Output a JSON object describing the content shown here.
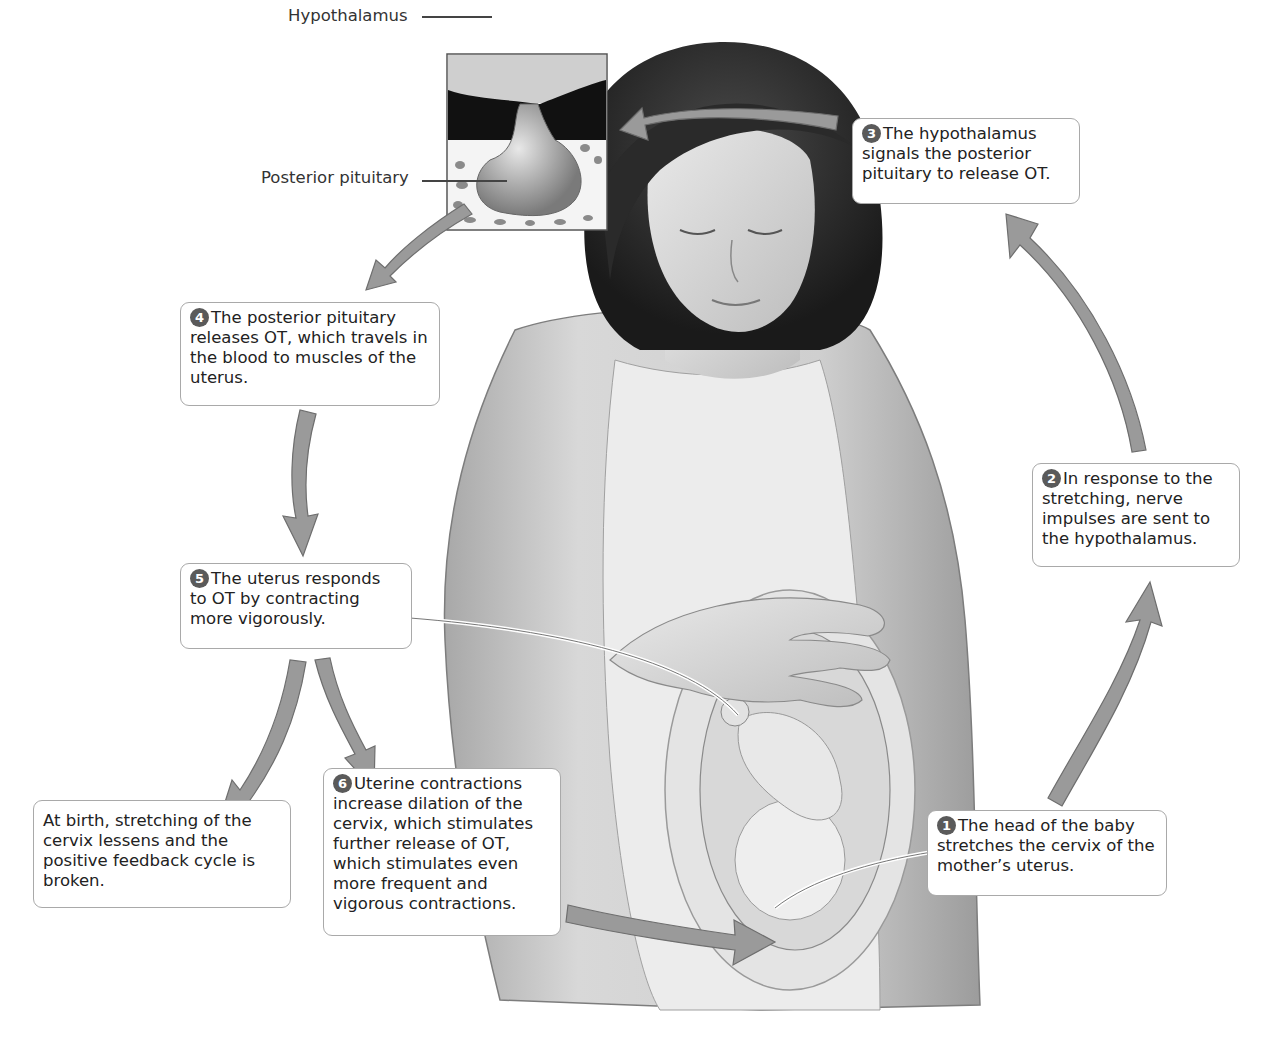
{
  "figure": {
    "type": "positive feedback loop diagram",
    "colors": {
      "arrow_fill": "#9a9a9a",
      "arrow_stroke": "#6e6e6e",
      "box_border": "#a9a9a9",
      "badge": "#5a5a5a",
      "text": "#222222"
    }
  },
  "inset": {
    "labels": {
      "hypothalamus": "Hypothalamus",
      "posterior_pituitary": "Posterior pituitary"
    }
  },
  "steps": [
    {
      "number": "1",
      "text": "The head of the baby stretches the cervix of the mother’s uterus."
    },
    {
      "number": "2",
      "text": "In response to the stretching, nerve impulses are sent to the hypothalamus."
    },
    {
      "number": "3",
      "text": "The hypothalamus signals the posterior pituitary to release OT."
    },
    {
      "number": "4",
      "text": "The posterior pituitary releases OT, which travels in the blood to muscles of the uterus."
    },
    {
      "number": "5",
      "text": "The uterus responds to OT by contracting more vigorously."
    },
    {
      "number": "6",
      "text": "Uterine contractions increase dilation of the cervix, which stimulates further release of OT, which stimulates even more frequent and vigorous contractions."
    }
  ],
  "exit_note": {
    "text": "At birth, stretching of the cervix lessens and the positive feedback cycle is broken."
  }
}
